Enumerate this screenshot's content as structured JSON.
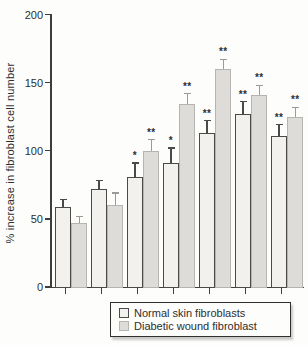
{
  "chart_data": {
    "type": "bar",
    "title": "",
    "xlabel": "",
    "ylabel": "% increase in fibroblast cell number",
    "ylim": [
      0,
      200
    ],
    "yticks": [
      0,
      50,
      100,
      150,
      200
    ],
    "x_tick_labels": [
      "",
      "",
      "",
      "",
      "",
      "",
      ""
    ],
    "grid": false,
    "legend_position": "bottom",
    "error_bars": "upper-only",
    "significance_note": "asterisks shown above error bars",
    "series": [
      {
        "name": "Normal skin fibroblasts",
        "values": [
          59,
          72,
          81,
          91,
          113,
          127,
          111
        ],
        "errors_plus": [
          5,
          6,
          10,
          11,
          9,
          9,
          8
        ],
        "significance": [
          "",
          "",
          "*",
          "*",
          "**",
          "**",
          "**"
        ],
        "fill": "#f2f1ee",
        "border": "#4a4a48",
        "error_color": "#4a4a48"
      },
      {
        "name": "Diabetic wound fibroblast",
        "values": [
          47,
          60,
          100,
          134,
          160,
          141,
          125
        ],
        "errors_plus": [
          5,
          9,
          8,
          8,
          7,
          7,
          7
        ],
        "significance": [
          "",
          "",
          "**",
          "**",
          "**",
          "**",
          "**"
        ],
        "fill": "#dedcd8",
        "border": "#b5b4b0",
        "error_color": "#9b9a96"
      }
    ],
    "colors": {
      "axis": "#3d3d3b",
      "text": "#2e2e2d",
      "background": "#fdfdfc"
    }
  }
}
